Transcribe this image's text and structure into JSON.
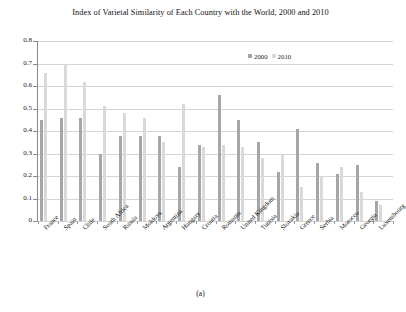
{
  "figure": {
    "title": "Index of Varietal Similarity of Each Country with the World, 2000 and 2010",
    "caption": "(a)"
  },
  "legend": {
    "position": "top-right-inside",
    "entries": [
      {
        "label": "2000",
        "color": "#a6a6a6"
      },
      {
        "label": "2010",
        "color": "#d9d9d9"
      }
    ]
  },
  "axes": {
    "y_tick_labels": [
      "0.8",
      "0.7",
      "0.6",
      "0.5",
      "0.4",
      "0.3",
      "0.2",
      "0.1",
      "0"
    ],
    "ylabel": "",
    "xlabel": ""
  },
  "chart_data": {
    "type": "bar",
    "title": "Index of Varietal Similarity of Each Country with the World, 2000 and 2010",
    "xlabel": "",
    "ylabel": "",
    "ylim": [
      0,
      0.8
    ],
    "ytick_interval": 0.1,
    "grid": true,
    "legend_position": "top-right-inside",
    "categories": [
      "France",
      "Spain",
      "Chile",
      "South Africa",
      "Russia",
      "Moldova",
      "Argentina",
      "Hungary",
      "Croatia",
      "Romania",
      "United Kingdom",
      "Tunisia",
      "Slovakia",
      "Greece",
      "Serbia",
      "Morocco",
      "Georgia",
      "Luxembourg"
    ],
    "series": [
      {
        "name": "2000",
        "color": "#a6a6a6",
        "values": [
          0.45,
          0.46,
          0.46,
          0.3,
          0.38,
          0.38,
          0.38,
          0.24,
          0.34,
          0.56,
          0.45,
          0.35,
          0.22,
          0.41,
          0.26,
          0.21,
          0.25,
          0.09
        ]
      },
      {
        "name": "2010",
        "color": "#d9d9d9",
        "values": [
          0.66,
          0.7,
          0.62,
          0.51,
          0.48,
          0.46,
          0.35,
          0.52,
          0.33,
          0.34,
          0.33,
          0.28,
          0.3,
          0.15,
          0.2,
          0.24,
          0.13,
          0.07
        ]
      }
    ]
  }
}
